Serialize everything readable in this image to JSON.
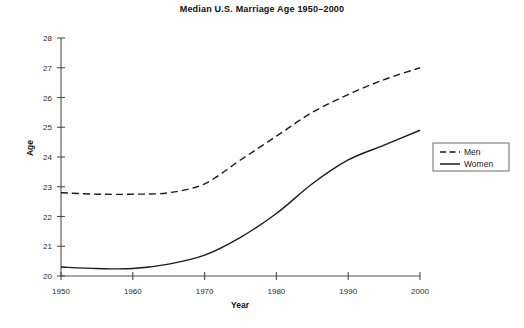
{
  "chart_data": {
    "type": "line",
    "title": "Median U.S. Marriage Age 1950–2000",
    "xlabel": "Year",
    "ylabel": "Age",
    "xlim": [
      1950,
      2000
    ],
    "ylim": [
      20,
      28
    ],
    "xticks": [
      1950,
      1960,
      1970,
      1980,
      1990,
      2000
    ],
    "yticks": [
      20,
      21,
      22,
      23,
      24,
      25,
      26,
      27,
      28
    ],
    "grid": false,
    "legend_position": "right",
    "x": [
      1950,
      1955,
      1960,
      1965,
      1970,
      1975,
      1980,
      1985,
      1990,
      1995,
      2000
    ],
    "series": [
      {
        "name": "Men",
        "style": "dashed",
        "color": "#1c1c1c",
        "values": [
          22.8,
          22.75,
          22.75,
          22.8,
          23.1,
          23.9,
          24.7,
          25.5,
          26.1,
          26.6,
          27.0
        ]
      },
      {
        "name": "Women",
        "style": "solid",
        "color": "#1c1c1c",
        "values": [
          20.3,
          20.25,
          20.25,
          20.4,
          20.7,
          21.3,
          22.1,
          23.1,
          23.9,
          24.4,
          24.9
        ]
      }
    ]
  },
  "legend": {
    "items": [
      {
        "label": "Men",
        "style": "dashed"
      },
      {
        "label": "Women",
        "style": "solid"
      }
    ]
  }
}
